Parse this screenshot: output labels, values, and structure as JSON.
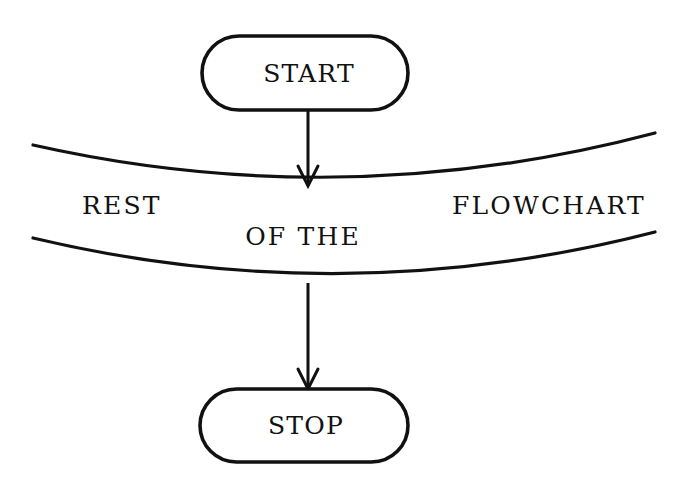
{
  "figure": {
    "kind": "flowchart",
    "background_color": "#ffffff",
    "ink_color": "#111111",
    "width": 685,
    "height": 497
  },
  "nodes": [
    {
      "id": "start",
      "shape": "stadium",
      "label": "START",
      "x": 202,
      "y": 36,
      "width": 206,
      "height": 74
    },
    {
      "id": "stop",
      "shape": "stadium",
      "label": "STOP",
      "x": 200,
      "y": 389,
      "width": 208,
      "height": 73
    }
  ],
  "connectors": [
    {
      "id": "start-to-break",
      "from": "start",
      "to": "break-top",
      "arrow": "down",
      "x": 308,
      "y_from": 110,
      "y_to": 186
    },
    {
      "id": "break-to-stop",
      "from": "break-bottom",
      "to": "stop",
      "arrow": "down",
      "x": 308,
      "y_from": 283,
      "y_to": 389
    }
  ],
  "break_region": {
    "id": "flowchart-break",
    "description": "elided middle section of the flowchart",
    "top_curve": {
      "x1": 33,
      "y1": 145,
      "cx": 344,
      "cy": 215,
      "x2": 655,
      "y2": 133
    },
    "bottom_curve": {
      "x1": 33,
      "y1": 238,
      "cx": 344,
      "cy": 312,
      "x2": 655,
      "y2": 232
    },
    "labels": [
      {
        "id": "rest",
        "text": "REST",
        "x": 82,
        "y": 214,
        "anchor": "start"
      },
      {
        "id": "of-the",
        "text": "OF  THE",
        "x": 303,
        "y": 245,
        "anchor": "middle"
      },
      {
        "id": "flowchart",
        "text": "FLOWCHART",
        "x": 646,
        "y": 214,
        "anchor": "end"
      }
    ],
    "full_text": "REST OF THE FLOWCHART"
  }
}
